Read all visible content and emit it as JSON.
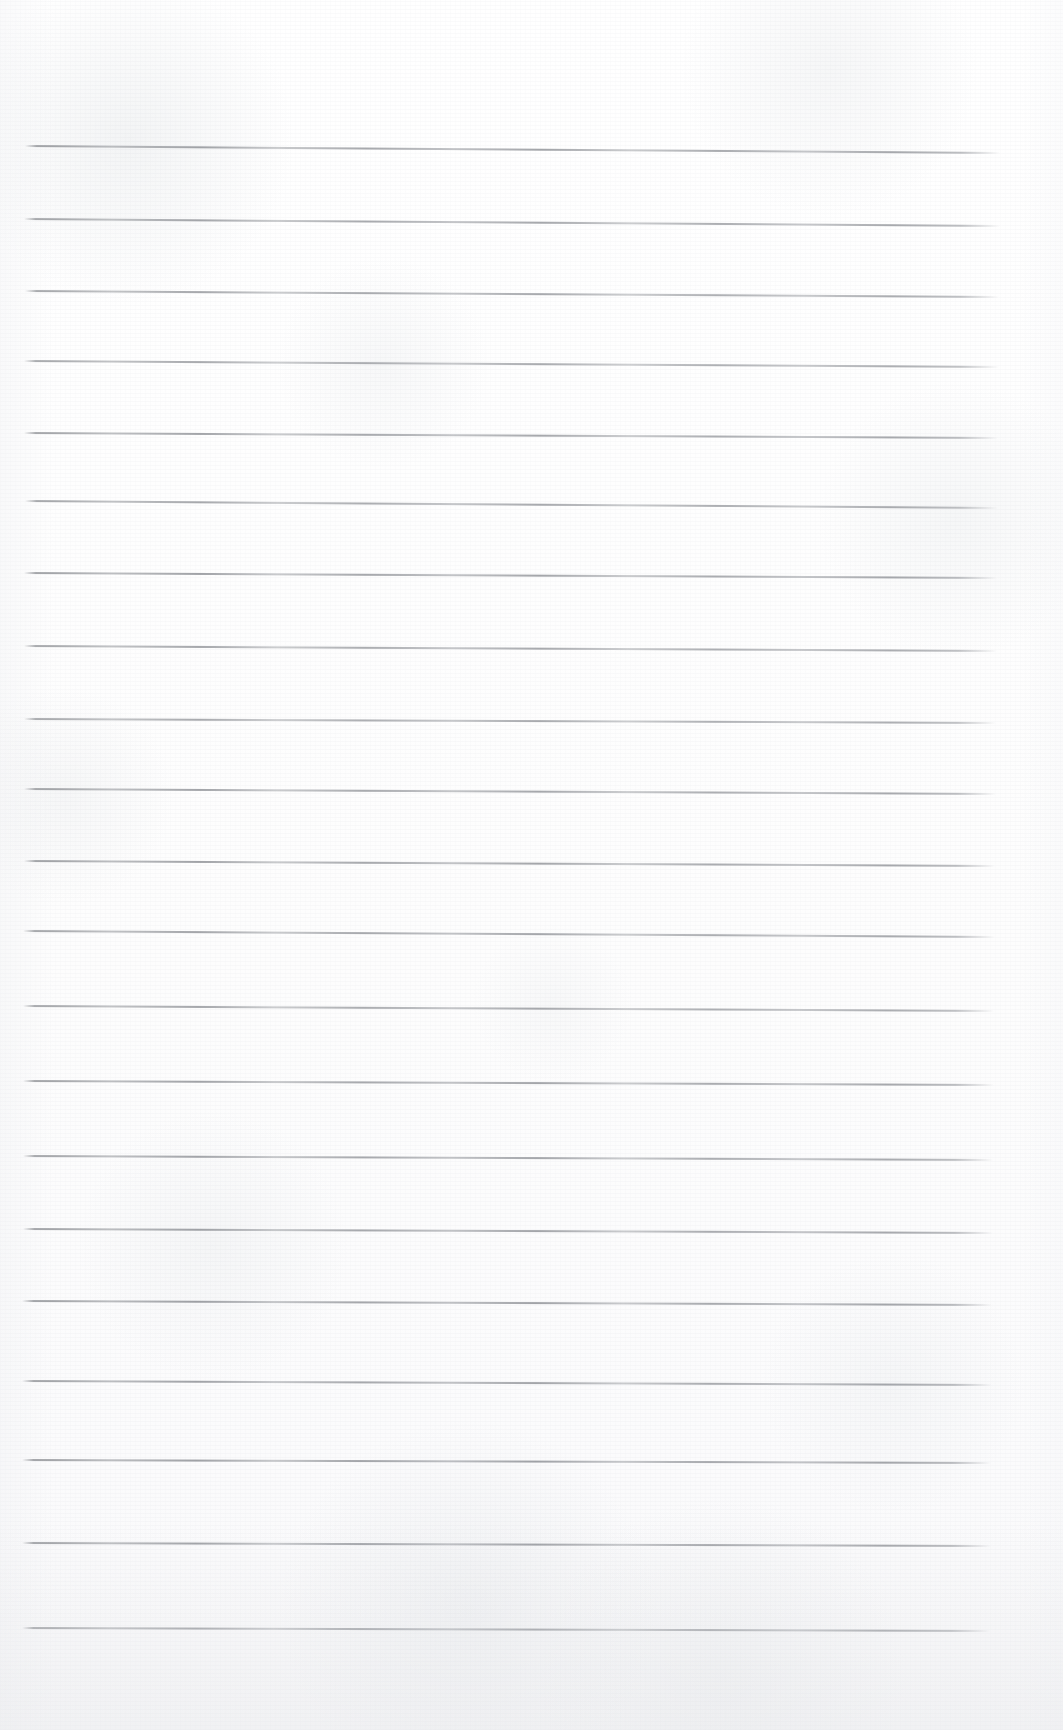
{
  "document": {
    "kind": "scanned-blank-lined-page",
    "title": "Scanned Blank Lined Page",
    "description": "A scanned, otherwise empty sheet of ruled notebook paper. No handwriting, no printed text, no page number, no header or footer.",
    "text_content": "",
    "page_width": 1063,
    "page_height": 1730,
    "background_color": "#fefefe",
    "rule_color": "#7d8086",
    "rule_count": 20,
    "rule_thickness_px": 1.5,
    "rule_left_x": 22,
    "rule_right_x": 1001,
    "top_margin_px": 145,
    "bottom_margin_px": 102,
    "lines": [
      {
        "index": 1,
        "y_left": 145,
        "y_right": 152,
        "x_start": 25,
        "x_end": 1000,
        "opacity": 0.86
      },
      {
        "index": 2,
        "y_left": 218,
        "y_right": 225,
        "x_start": 24,
        "x_end": 1000,
        "opacity": 0.84
      },
      {
        "index": 3,
        "y_left": 290,
        "y_right": 296,
        "x_start": 25,
        "x_end": 999,
        "opacity": 0.82
      },
      {
        "index": 4,
        "y_left": 360,
        "y_right": 366,
        "x_start": 24,
        "x_end": 999,
        "opacity": 0.8
      },
      {
        "index": 5,
        "y_left": 432,
        "y_right": 437,
        "x_start": 24,
        "x_end": 998,
        "opacity": 0.84
      },
      {
        "index": 6,
        "y_left": 500,
        "y_right": 507,
        "x_start": 25,
        "x_end": 998,
        "opacity": 0.82
      },
      {
        "index": 7,
        "y_left": 572,
        "y_right": 577,
        "x_start": 24,
        "x_end": 997,
        "opacity": 0.86
      },
      {
        "index": 8,
        "y_left": 645,
        "y_right": 650,
        "x_start": 24,
        "x_end": 997,
        "opacity": 0.82
      },
      {
        "index": 9,
        "y_left": 718,
        "y_right": 722,
        "x_start": 24,
        "x_end": 996,
        "opacity": 0.8
      },
      {
        "index": 10,
        "y_left": 788,
        "y_right": 793,
        "x_start": 24,
        "x_end": 996,
        "opacity": 0.84
      },
      {
        "index": 11,
        "y_left": 860,
        "y_right": 865,
        "x_start": 24,
        "x_end": 995,
        "opacity": 0.86
      },
      {
        "index": 12,
        "y_left": 930,
        "y_right": 936,
        "x_start": 23,
        "x_end": 995,
        "opacity": 0.84
      },
      {
        "index": 13,
        "y_left": 1005,
        "y_right": 1010,
        "x_start": 23,
        "x_end": 994,
        "opacity": 0.82
      },
      {
        "index": 14,
        "y_left": 1080,
        "y_right": 1084,
        "x_start": 23,
        "x_end": 994,
        "opacity": 0.86
      },
      {
        "index": 15,
        "y_left": 1155,
        "y_right": 1159,
        "x_start": 23,
        "x_end": 993,
        "opacity": 0.84
      },
      {
        "index": 16,
        "y_left": 1228,
        "y_right": 1232,
        "x_start": 23,
        "x_end": 993,
        "opacity": 0.86
      },
      {
        "index": 17,
        "y_left": 1300,
        "y_right": 1304,
        "x_start": 22,
        "x_end": 992,
        "opacity": 0.88
      },
      {
        "index": 18,
        "y_left": 1380,
        "y_right": 1384,
        "x_start": 22,
        "x_end": 992,
        "opacity": 0.86
      },
      {
        "index": 19,
        "y_left": 1459,
        "y_right": 1462,
        "x_start": 22,
        "x_end": 991,
        "opacity": 0.88
      },
      {
        "index": 20,
        "y_left": 1542,
        "y_right": 1545,
        "x_start": 22,
        "x_end": 991,
        "opacity": 0.88
      },
      {
        "index": 21,
        "y_left": 1627,
        "y_right": 1630,
        "x_start": 22,
        "x_end": 990,
        "opacity": 0.9
      }
    ]
  }
}
